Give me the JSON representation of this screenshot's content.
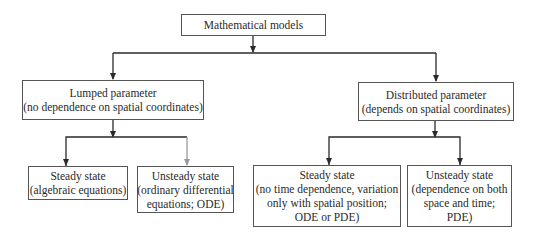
{
  "diagram": {
    "root": {
      "label": "Mathematical models"
    },
    "lumped": {
      "title": "Lumped parameter",
      "subtitle": "(no dependence on spatial coordinates)"
    },
    "distributed": {
      "title": "Distributed parameter",
      "subtitle": "(depends on spatial coordinates)"
    },
    "lumped_steady": {
      "lines": [
        "Steady state",
        "(algebraic equations)"
      ]
    },
    "lumped_unsteady": {
      "lines": [
        "Unsteady state",
        "(ordinary differential",
        "equations; ODE)"
      ]
    },
    "distributed_steady": {
      "lines": [
        "Steady state",
        "(no time dependence, variation",
        "only with spatial position;",
        "ODE or PDE)"
      ]
    },
    "distributed_unsteady": {
      "lines": [
        "Unsteady state",
        "(dependence on both",
        "space and time;",
        "PDE)"
      ]
    },
    "colors": {
      "line": "#2a2a2a",
      "gray_arrow": "#9a9a9a",
      "border": "#555555"
    }
  }
}
